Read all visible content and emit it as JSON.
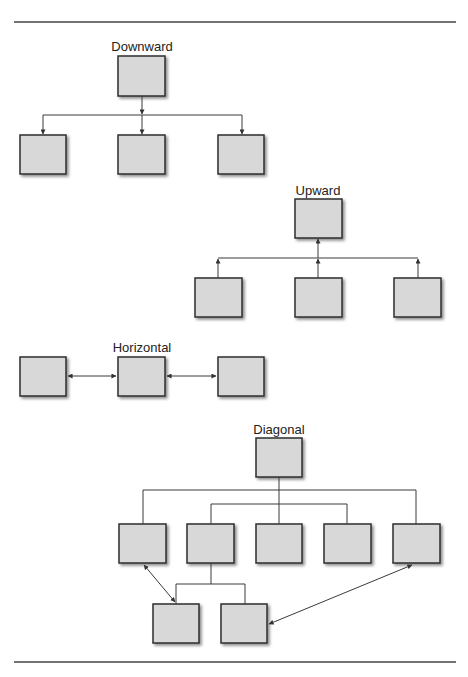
{
  "diagram": {
    "colors": {
      "box_fill": "#d8d8d8",
      "box_stroke": "#2e2e2e",
      "line": "#3a3a3a",
      "rule": "#444444"
    },
    "sections": [
      {
        "id": "downward",
        "label": "Downward",
        "label_x": 142,
        "label_y": 51
      },
      {
        "id": "upward",
        "label": "Upward",
        "label_x": 318,
        "label_y": 195
      },
      {
        "id": "horizontal",
        "label": "Horizontal",
        "label_x": 142,
        "label_y": 352
      },
      {
        "id": "diagonal",
        "label": "Diagonal",
        "label_x": 279,
        "label_y": 434
      }
    ]
  }
}
